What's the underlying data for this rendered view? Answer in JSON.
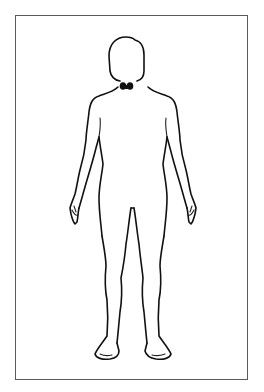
{
  "diagram": {
    "type": "anatomical-body-outline",
    "view": "anterior",
    "highlighted_organ": {
      "name": "thyroid",
      "location": "neck",
      "color": "#111111"
    },
    "colors": {
      "background": "#ffffff",
      "frame_border": "#5a5a5a",
      "outline": "#111111"
    },
    "labels": []
  }
}
